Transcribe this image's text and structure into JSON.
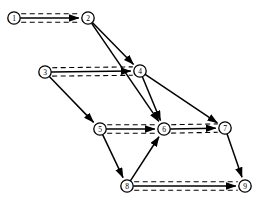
{
  "diagram": {
    "width": 264,
    "height": 206,
    "background_color": "#ffffff",
    "stroke_color": "#000000",
    "node_radius": 6.2,
    "channel_offset": 4.2,
    "nodes": [
      {
        "id": "n1",
        "label": "1",
        "x": 14,
        "y": 18
      },
      {
        "id": "n2",
        "label": "2",
        "x": 88,
        "y": 18
      },
      {
        "id": "n3",
        "label": "3",
        "x": 45,
        "y": 72
      },
      {
        "id": "n4",
        "label": "4",
        "x": 140,
        "y": 71
      },
      {
        "id": "n5",
        "label": "5",
        "x": 100,
        "y": 129
      },
      {
        "id": "n6",
        "label": "6",
        "x": 164,
        "y": 129
      },
      {
        "id": "n7",
        "label": "7",
        "x": 225,
        "y": 128
      },
      {
        "id": "n8",
        "label": "8",
        "x": 127,
        "y": 186
      },
      {
        "id": "n9",
        "label": "9",
        "x": 245,
        "y": 186
      }
    ],
    "channel_edges": [
      {
        "id": "e1-2",
        "from": "n1",
        "to": "n2",
        "style": "dashed-channel-with-arrow"
      },
      {
        "id": "e3-4",
        "from": "n3",
        "to": "n4",
        "style": "dashed-channel-with-arrow"
      },
      {
        "id": "e5-6",
        "from": "n5",
        "to": "n6",
        "style": "dashed-channel-with-arrow"
      },
      {
        "id": "e6-7",
        "from": "n6",
        "to": "n7",
        "style": "dashed-channel-with-arrow"
      },
      {
        "id": "e8-9",
        "from": "n8",
        "to": "n9",
        "style": "dashed-channel-with-arrow"
      }
    ],
    "diagonal_edges": [
      {
        "id": "e2-4",
        "from": "n2",
        "to": "n4",
        "style": "solid-arrow"
      },
      {
        "id": "e2-6",
        "from": "n2",
        "to": "n6",
        "style": "solid-arrow"
      },
      {
        "id": "e3-5",
        "from": "n3",
        "to": "n5",
        "style": "solid-arrow"
      },
      {
        "id": "e4-6",
        "from": "n4",
        "to": "n6",
        "style": "solid-arrow"
      },
      {
        "id": "e4-7",
        "from": "n4",
        "to": "n7",
        "style": "solid-arrow"
      },
      {
        "id": "e5-8",
        "from": "n5",
        "to": "n8",
        "style": "solid-arrow"
      },
      {
        "id": "e8-6",
        "from": "n8",
        "to": "n6",
        "style": "solid-arrow"
      },
      {
        "id": "e7-9",
        "from": "n7",
        "to": "n9",
        "style": "solid-arrow"
      }
    ]
  }
}
